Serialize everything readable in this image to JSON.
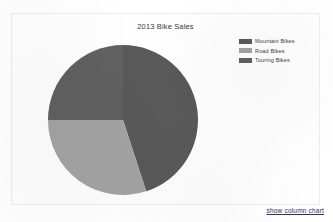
{
  "chart": {
    "title": "2013 Bike Sales",
    "panel_border_color": "#ededed",
    "background_color": "#ffffff"
  },
  "legend": {
    "position": "top-right",
    "items": [
      {
        "label": "Mountain Bikes",
        "color": "#595959"
      },
      {
        "label": "Road Bikes",
        "color": "#a3a3a3"
      },
      {
        "label": "Touring Bikes",
        "color": "#606060"
      }
    ]
  },
  "footer": {
    "link_label": "show column chart"
  },
  "chart_data": {
    "type": "pie",
    "title": "2013 Bike Sales",
    "xlabel": "",
    "ylabel": "",
    "legend_position": "top-right",
    "grid": false,
    "categories": [
      "Mountain Bikes",
      "Road Bikes",
      "Touring Bikes"
    ],
    "values": [
      45,
      30,
      25
    ],
    "unit": "percent",
    "colors": [
      "#595959",
      "#a3a3a3",
      "#606060"
    ],
    "series": [
      {
        "name": "2013 Bike Sales",
        "values": [
          45,
          30,
          25
        ]
      }
    ],
    "slices": [
      {
        "label": "Mountain Bikes",
        "value": 45,
        "color": "#595959",
        "start_angle_deg": 0,
        "end_angle_deg": 162
      },
      {
        "label": "Road Bikes",
        "value": 30,
        "color": "#a3a3a3",
        "start_angle_deg": 198,
        "end_angle_deg": 306
      },
      {
        "label": "Touring Bikes",
        "value": 25,
        "color": "#606060",
        "start_angle_deg": 162,
        "end_angle_deg": 198
      }
    ]
  }
}
